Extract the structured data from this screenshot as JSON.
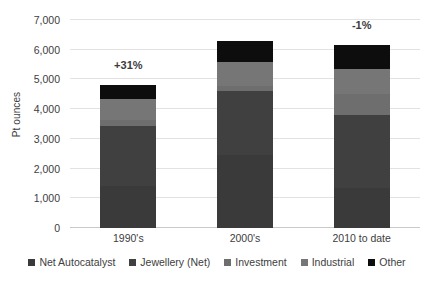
{
  "chart_data": {
    "type": "bar",
    "stacked": true,
    "title": "",
    "xlabel": "",
    "ylabel": "Pt ounces",
    "categories": [
      "1990's",
      "2000's",
      "2010 to date"
    ],
    "ylim": [
      0,
      7000
    ],
    "yticks": [
      0,
      1000,
      2000,
      3000,
      4000,
      5000,
      6000,
      7000
    ],
    "ytick_labels": [
      "0",
      "1,000",
      "2,000",
      "3,000",
      "4,000",
      "5,000",
      "6,000",
      "7,000"
    ],
    "grid": true,
    "legend_position": "bottom",
    "series": [
      {
        "name": "Net Autocatalyst",
        "color": "#3a3a3a",
        "values": [
          1400,
          2450,
          1350
        ]
      },
      {
        "name": "Jewellery (Net)",
        "color": "#404040",
        "values": [
          2050,
          2150,
          2450
        ]
      },
      {
        "name": "Investment",
        "color": "#6e6e6e",
        "values": [
          200,
          180,
          700
        ]
      },
      {
        "name": "Industrial",
        "color": "#767676",
        "values": [
          700,
          800,
          850
        ]
      },
      {
        "name": "Other",
        "color": "#0d0d0d",
        "values": [
          450,
          700,
          800
        ]
      }
    ],
    "totals": [
      4800,
      6280,
      6150
    ],
    "annotations": [
      {
        "category": "1990's",
        "text": "+31%"
      },
      {
        "category": "2010 to date",
        "text": "-1%"
      }
    ]
  },
  "legend": {
    "items": [
      {
        "label": "Net Autocatalyst"
      },
      {
        "label": "Jewellery (Net)"
      },
      {
        "label": "Investment"
      },
      {
        "label": "Industrial"
      },
      {
        "label": "Other"
      }
    ]
  },
  "colors": {
    "background": "#ffffff",
    "gridline": "#e2e2e2",
    "axis": "#c9c9c9",
    "text": "#404040",
    "annotation": "#3b3b3b"
  }
}
